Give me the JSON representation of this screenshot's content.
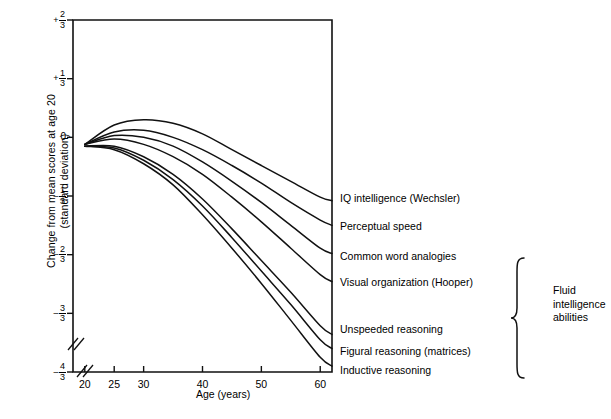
{
  "chart_data": {
    "type": "line",
    "title": "",
    "xlabel": "Age (years)",
    "ylabel": "Change from mean scores at age 20\n(standard deviation)",
    "xlim": [
      18,
      62
    ],
    "ylim": [
      -1.3333,
      0.6667
    ],
    "grid": false,
    "legend_position": "right-of-plot-line-end-labels",
    "xticks": [
      {
        "value": 20,
        "label": "20"
      },
      {
        "value": 25,
        "label": "25"
      },
      {
        "value": 30,
        "label": "30"
      },
      {
        "value": 40,
        "label": "40"
      },
      {
        "value": 50,
        "label": "50"
      },
      {
        "value": 60,
        "label": "60"
      }
    ],
    "yticks": [
      {
        "value": 0.6667,
        "sign": "+",
        "num": "2",
        "den": "3",
        "label": "+2/3"
      },
      {
        "value": 0.3333,
        "sign": "+",
        "num": "1",
        "den": "3",
        "label": "+1/3"
      },
      {
        "value": 0.0,
        "sign": "",
        "num": "",
        "den": "",
        "label": "0"
      },
      {
        "value": -0.3333,
        "sign": "–",
        "num": "1",
        "den": "3",
        "label": "-1/3"
      },
      {
        "value": -0.6667,
        "sign": "–",
        "num": "2",
        "den": "3",
        "label": "-2/3"
      },
      {
        "value": -1.0,
        "sign": "–",
        "num": "3",
        "den": "3",
        "label": "-3/3"
      },
      {
        "value": -1.3333,
        "sign": "–",
        "num": "4",
        "den": "3",
        "label": "-4/3"
      }
    ],
    "axis_break": true,
    "x": [
      20,
      25,
      30,
      35,
      40,
      45,
      50,
      55,
      60,
      62
    ],
    "series": [
      {
        "name": "IQ intelligence  (Wechsler)",
        "end_value": -0.36,
        "values": [
          -0.04,
          0.07,
          0.1,
          0.08,
          0.02,
          -0.07,
          -0.16,
          -0.25,
          -0.34,
          -0.36
        ]
      },
      {
        "name": "Perceptual speed",
        "end_value": -0.5,
        "values": [
          -0.04,
          0.03,
          0.04,
          0.0,
          -0.07,
          -0.16,
          -0.26,
          -0.37,
          -0.47,
          -0.5
        ]
      },
      {
        "name": "Common word analogies",
        "end_value": -0.66,
        "values": [
          -0.04,
          0.01,
          0.0,
          -0.05,
          -0.14,
          -0.25,
          -0.37,
          -0.5,
          -0.63,
          -0.66
        ]
      },
      {
        "name": "Visual organization  (Hooper)",
        "end_value": -0.82,
        "values": [
          -0.04,
          -0.01,
          -0.04,
          -0.11,
          -0.21,
          -0.34,
          -0.48,
          -0.63,
          -0.78,
          -0.82
        ]
      },
      {
        "name": "Unspeeded reasoning",
        "end_value": -1.12,
        "values": [
          -0.05,
          -0.05,
          -0.11,
          -0.21,
          -0.35,
          -0.52,
          -0.7,
          -0.88,
          -1.07,
          -1.12
        ]
      },
      {
        "name": "Figural reasoning  (matrices)",
        "end_value": -1.2,
        "values": [
          -0.05,
          -0.06,
          -0.13,
          -0.24,
          -0.39,
          -0.57,
          -0.76,
          -0.95,
          -1.15,
          -1.2
        ]
      },
      {
        "name": "Inductive reasoning",
        "end_value": -1.3,
        "values": [
          -0.05,
          -0.07,
          -0.15,
          -0.27,
          -0.44,
          -0.63,
          -0.83,
          -1.04,
          -1.25,
          -1.3
        ]
      }
    ],
    "annotations": [
      {
        "text": "Fluid\nintelligence\nabilities",
        "brace": true
      }
    ]
  }
}
